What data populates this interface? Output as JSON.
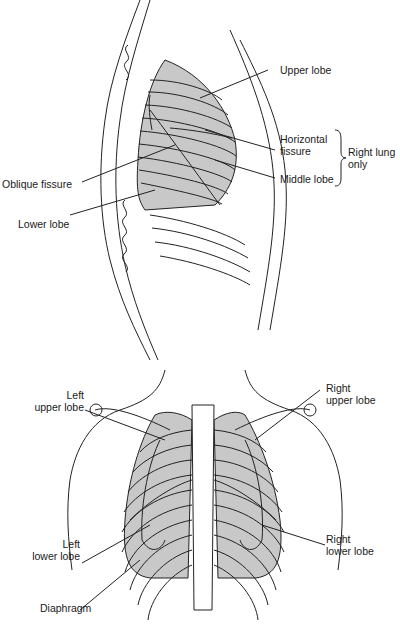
{
  "lateral_view": {
    "labels": {
      "upper_lobe": "Upper lobe",
      "horizontal_fissure_1": "Horizontal",
      "horizontal_fissure_2": "fissure",
      "middle_lobe": "Middle lobe",
      "right_lung_only_1": "Right lung",
      "right_lung_only_2": "only",
      "oblique_fissure": "Oblique fissure",
      "lower_lobe": "Lower lobe"
    }
  },
  "posterior_view": {
    "labels": {
      "left_upper_lobe_1": "Left",
      "left_upper_lobe_2": "upper lobe",
      "right_upper_lobe_1": "Right",
      "right_upper_lobe_2": "upper lobe",
      "left_lower_lobe_1": "Left",
      "left_lower_lobe_2": "lower lobe",
      "right_lower_lobe_1": "Right",
      "right_lower_lobe_2": "lower lobe",
      "diaphragm": "Diaphragm"
    }
  },
  "colors": {
    "lung_fill": "#c8c8c8",
    "line": "#222222"
  }
}
